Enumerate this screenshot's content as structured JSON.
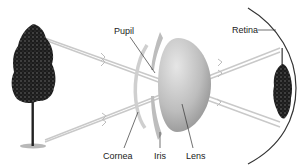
{
  "diagram": {
    "labels": {
      "pupil": "Pupil",
      "retina": "Retina",
      "cornea": "Cornea",
      "iris": "Iris",
      "lens": "Lens"
    },
    "objects": {
      "source": "tree-upright",
      "image": "tree-inverted-on-retina"
    },
    "colors": {
      "ray": "#c8c8c8",
      "cornea": "#cfcfcf",
      "iris": "#bdbdbd",
      "lens_light": "#d9d9d9",
      "lens_dark": "#9a9a9a",
      "retina": "#333333",
      "leader": "#333333",
      "tree": "#1a1a1a"
    }
  }
}
